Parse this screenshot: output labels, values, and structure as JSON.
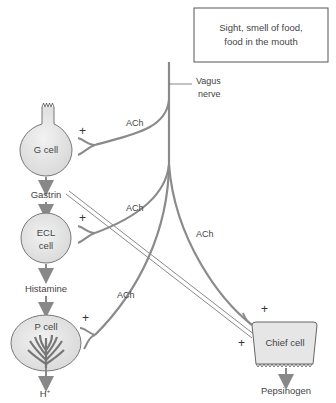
{
  "stimulus_box": {
    "line1": "Sight, smell of food,",
    "line2": "food in the mouth"
  },
  "vagus": {
    "line1": "Vagus",
    "line2": "nerve"
  },
  "ach_labels": [
    "ACh",
    "ACh",
    "ACh",
    "ACh"
  ],
  "cells": {
    "g_cell": "G cell",
    "ecl_cell_line1": "ECL",
    "ecl_cell_line2": "cell",
    "p_cell": "P cell",
    "chief_cell": "Chief cell"
  },
  "mediators": {
    "gastrin": "Gastrin",
    "histamine": "Histamine"
  },
  "outputs": {
    "h_plus": "H",
    "h_plus_sup": "+",
    "pepsinogen": "Pepsinogen"
  },
  "plus_sign": "+",
  "colors": {
    "cell_fill": "#e6e6e6",
    "line": "#8a8a8a",
    "box_border": "#555555"
  }
}
